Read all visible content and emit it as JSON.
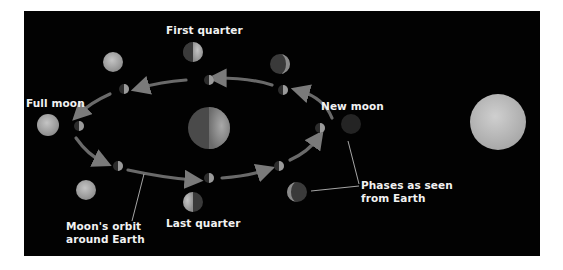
{
  "diagram": {
    "background_color": "#020202",
    "labels": {
      "first_quarter": "First quarter",
      "full_moon": "Full moon",
      "new_moon": "New moon",
      "last_quarter": "Last quarter",
      "orbit_line1": "Moon's orbit",
      "orbit_line2": "around Earth",
      "phases_line1": "Phases as seen",
      "phases_line2": "from Earth"
    },
    "bodies": {
      "earth": "Earth",
      "sun": "Sun",
      "moon": "Moon"
    },
    "phases": [
      "First quarter",
      "Waxing gibbous",
      "Full moon",
      "Waning gibbous",
      "Last quarter",
      "Waning crescent",
      "New moon",
      "Waxing crescent"
    ],
    "colors": {
      "orbit_arrow": "#6e6e6e",
      "sun": "#bdbdbd",
      "moon_lit": "#b8b8b8",
      "moon_dark": "#2a2a2a",
      "label_text": "#f2f2f2",
      "leader_line": "#cfcfcf"
    }
  }
}
